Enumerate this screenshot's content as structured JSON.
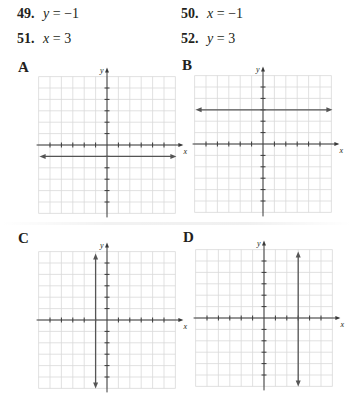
{
  "problems": [
    {
      "number": "49.",
      "lhs": "y",
      "op": "=",
      "rhs": "−1"
    },
    {
      "number": "50.",
      "lhs": "x",
      "op": "=",
      "rhs": "−1"
    },
    {
      "number": "51.",
      "lhs": "x",
      "op": "=",
      "rhs": "3"
    },
    {
      "number": "52.",
      "lhs": "y",
      "op": "=",
      "rhs": "3"
    }
  ],
  "graphs": [
    {
      "label": "A",
      "line": "horizontal",
      "value": -1,
      "x_axis_label": "x",
      "y_axis_label": "y"
    },
    {
      "label": "B",
      "line": "horizontal",
      "value": 3,
      "x_axis_label": "x",
      "y_axis_label": "y"
    },
    {
      "label": "C",
      "line": "vertical",
      "value": -1,
      "x_axis_label": "x",
      "y_axis_label": "y"
    },
    {
      "label": "D",
      "line": "vertical",
      "value": 3,
      "x_axis_label": "x",
      "y_axis_label": "y"
    }
  ],
  "colors": {
    "grid": "#d9d9d9",
    "axis": "#3a3a3a",
    "line": "#555555",
    "text": "#231f20"
  }
}
